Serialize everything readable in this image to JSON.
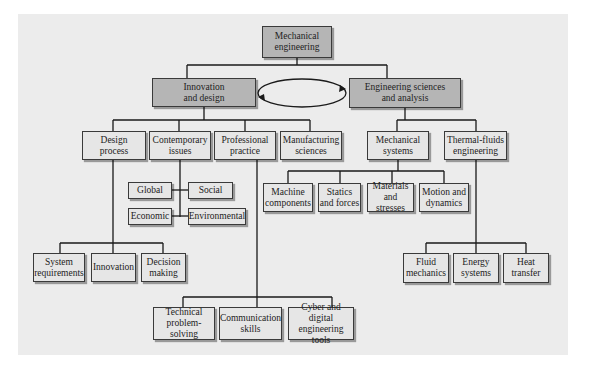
{
  "diagram": {
    "root": "Mechanical\nengineering",
    "branches": {
      "innovation": "Innovation\nand design",
      "sciences": "Engineering sciences\nand analysis"
    },
    "innovation_children": {
      "design_process": "Design\nprocess",
      "contemporary_issues": "Contemporary\nissues",
      "professional_practice": "Professional\npractice",
      "manufacturing_sciences": "Manufacturing\nsciences"
    },
    "sciences_children": {
      "mechanical_systems": "Mechanical\nsystems",
      "thermal_fluids": "Thermal-fluids\nengineering"
    },
    "contemporary_issues_children": {
      "global": "Global",
      "social": "Social",
      "economic": "Economic",
      "environmental": "Environmental"
    },
    "mechanical_systems_children": {
      "machine_components": "Machine\ncomponents",
      "statics_forces": "Statics\nand forces",
      "materials_stresses": "Materials\nand stresses",
      "motion_dynamics": "Motion and\ndynamics"
    },
    "design_process_children": {
      "system_requirements": "System\nrequirements",
      "innovation": "Innovation",
      "decision_making": "Decision\nmaking"
    },
    "thermal_fluids_children": {
      "fluid_mechanics": "Fluid\nmechanics",
      "energy_systems": "Energy\nsystems",
      "heat_transfer": "Heat\ntransfer"
    },
    "professional_practice_children": {
      "technical_problem_solving": "Technical\nproblem-solving",
      "communication_skills": "Communication\nskills",
      "cyber_digital_tools": "Cyber and digital\nengineering tools"
    }
  },
  "colors": {
    "panel_bg": "#ececec",
    "primary_box": "#b5b5b5",
    "secondary_box": "#e6e6e6",
    "line": "#1a1a1a"
  }
}
